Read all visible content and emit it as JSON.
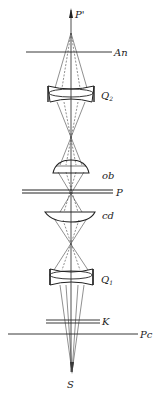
{
  "diagram": {
    "type": "optical-path-schematic",
    "axis_top_label": "P'",
    "axis_bottom_label": "S",
    "elements": [
      {
        "id": "An",
        "label": "An",
        "kind": "plane",
        "y": 52
      },
      {
        "id": "Q2",
        "label": "Q",
        "subscript": "2",
        "kind": "lens-assembly",
        "y": 93
      },
      {
        "id": "ob",
        "label": "ob",
        "kind": "lens-objective",
        "y": 168
      },
      {
        "id": "P",
        "label": "P",
        "kind": "double-plane",
        "y": 191
      },
      {
        "id": "cd",
        "label": "cd",
        "kind": "lens-condenser",
        "y": 215
      },
      {
        "id": "Q1",
        "label": "Q",
        "subscript": "1",
        "kind": "lens-assembly",
        "y": 276
      },
      {
        "id": "K",
        "label": "K",
        "kind": "double-plane",
        "y": 321
      },
      {
        "id": "Pc",
        "label": "Pc",
        "kind": "plane",
        "y": 334
      }
    ]
  }
}
